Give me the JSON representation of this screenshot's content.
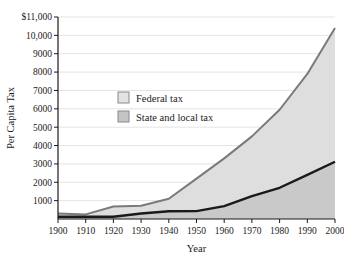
{
  "chart_data": {
    "type": "area",
    "title": "",
    "subtitle": "",
    "xlabel": "Year",
    "ylabel": "Per Capita Tax",
    "x": [
      1900,
      1910,
      1920,
      1930,
      1940,
      1950,
      1960,
      1970,
      1980,
      1990,
      2000
    ],
    "categories": [
      "1900",
      "1910",
      "1920",
      "1930",
      "1940",
      "1950",
      "1960",
      "1970",
      "1980",
      "1990",
      "2000"
    ],
    "xlim": [
      1900,
      2000
    ],
    "ylim": [
      0,
      11000
    ],
    "yticks": [
      1000,
      2000,
      3000,
      4000,
      5000,
      6000,
      7000,
      8000,
      9000,
      10000,
      11000
    ],
    "ytick_labels": [
      "1000",
      "2000",
      "3000",
      "4000",
      "5000",
      "6000",
      "7000",
      "8000",
      "9000",
      "10,000",
      "$11,000"
    ],
    "xticks": [
      1900,
      1910,
      1920,
      1930,
      1940,
      1950,
      1960,
      1970,
      1980,
      1990,
      2000
    ],
    "xtick_labels": [
      "1900",
      "1910",
      "1920",
      "1930",
      "1940",
      "1950",
      "1960",
      "1970",
      "1980",
      "1990",
      "2000"
    ],
    "grid": "horizontal",
    "legend_position": "inside-upper-left",
    "stacked": true,
    "series": [
      {
        "name": "State and local tax",
        "color": "#1a1a1a",
        "fill": "#c9c9c9",
        "values": [
          120,
          120,
          120,
          300,
          420,
          430,
          700,
          1250,
          1700,
          2400,
          3120
        ]
      },
      {
        "name": "Federal tax",
        "color": "#7a7a7a",
        "fill": "#dedede",
        "values": [
          180,
          130,
          560,
          420,
          680,
          1770,
          2600,
          3250,
          4250,
          5500,
          7280
        ]
      }
    ],
    "total_values": [
      300,
      250,
      680,
      720,
      1100,
      2200,
      3300,
      4500,
      5950,
      7900,
      10400
    ]
  },
  "legend": {
    "items": [
      {
        "label": "Federal tax",
        "swatch": "#e2e2e2"
      },
      {
        "label": "State and local tax",
        "swatch": "#c4c4c4"
      }
    ]
  },
  "axes": {
    "y_title": "Per Capita Tax",
    "x_title": "Year"
  }
}
